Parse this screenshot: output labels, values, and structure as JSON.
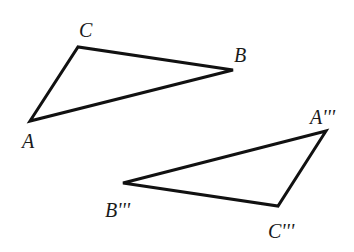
{
  "diagram": {
    "stroke_color": "#111111",
    "background": "#ffffff",
    "triangles": [
      {
        "name": "ABC",
        "vertices": [
          {
            "label": "A",
            "x": 30,
            "y": 121,
            "lx": 22,
            "ly": 148
          },
          {
            "label": "C",
            "x": 78,
            "y": 47,
            "lx": 79,
            "ly": 37
          },
          {
            "label": "B",
            "x": 233,
            "y": 70,
            "lx": 234,
            "ly": 62
          }
        ]
      },
      {
        "name": "A'''B'''C'''",
        "vertices": [
          {
            "label": "A'''",
            "x": 326,
            "y": 131,
            "lx": 310,
            "ly": 124
          },
          {
            "label": "B'''",
            "x": 123,
            "y": 183,
            "lx": 105,
            "ly": 217
          },
          {
            "label": "C'''",
            "x": 278,
            "y": 206,
            "lx": 268,
            "ly": 238
          }
        ]
      }
    ]
  }
}
